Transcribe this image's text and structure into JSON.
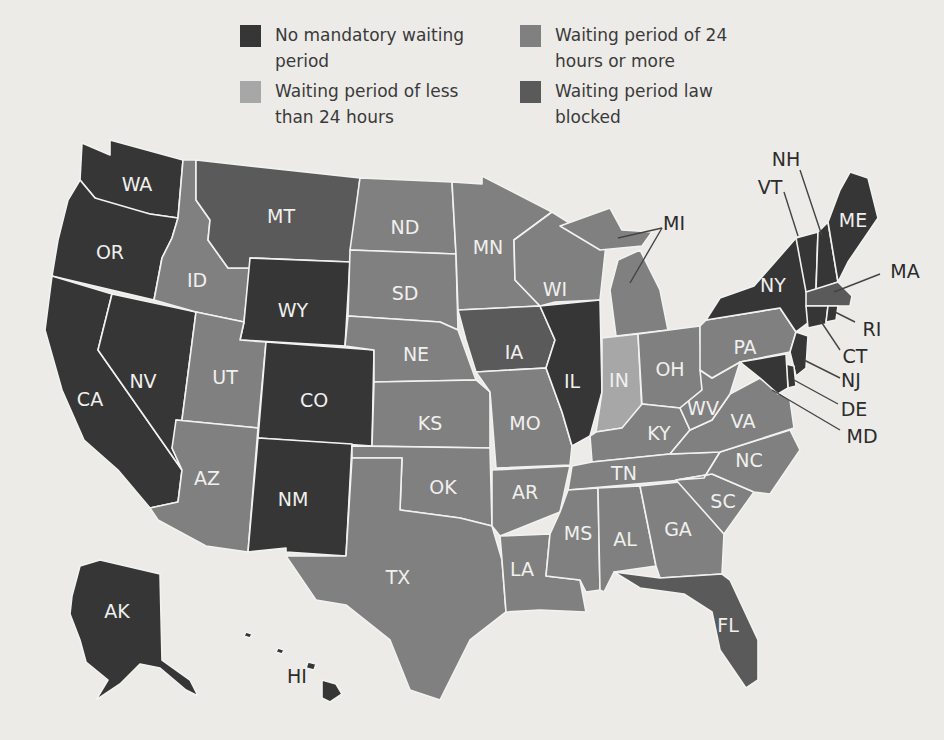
{
  "colors": {
    "none": "#363636",
    "lt24": "#a7a7a7",
    "gte24": "#808080",
    "blocked": "#5a5a5a",
    "background": "#ecebe8"
  },
  "legend": [
    {
      "key": "none",
      "label": "No mandatory waiting period",
      "color": "#363636"
    },
    {
      "key": "gte24",
      "label": "Waiting period of 24 hours or more",
      "color": "#808080"
    },
    {
      "key": "lt24",
      "label": "Waiting period of less than 24 hours",
      "color": "#a7a7a7"
    },
    {
      "key": "blocked",
      "label": "Waiting period law blocked",
      "color": "#5a5a5a"
    }
  ],
  "states": {
    "WA": {
      "label": "WA",
      "category": "none"
    },
    "OR": {
      "label": "OR",
      "category": "none"
    },
    "CA": {
      "label": "CA",
      "category": "none"
    },
    "NV": {
      "label": "NV",
      "category": "none"
    },
    "ID": {
      "label": "ID",
      "category": "gte24"
    },
    "MT": {
      "label": "MT",
      "category": "blocked"
    },
    "WY": {
      "label": "WY",
      "category": "none"
    },
    "UT": {
      "label": "UT",
      "category": "gte24"
    },
    "CO": {
      "label": "CO",
      "category": "none"
    },
    "AZ": {
      "label": "AZ",
      "category": "gte24"
    },
    "NM": {
      "label": "NM",
      "category": "none"
    },
    "ND": {
      "label": "ND",
      "category": "gte24"
    },
    "SD": {
      "label": "SD",
      "category": "gte24"
    },
    "NE": {
      "label": "NE",
      "category": "gte24"
    },
    "KS": {
      "label": "KS",
      "category": "gte24"
    },
    "OK": {
      "label": "OK",
      "category": "gte24"
    },
    "TX": {
      "label": "TX",
      "category": "gte24"
    },
    "MN": {
      "label": "MN",
      "category": "gte24"
    },
    "IA": {
      "label": "IA",
      "category": "blocked"
    },
    "MO": {
      "label": "MO",
      "category": "gte24"
    },
    "AR": {
      "label": "AR",
      "category": "gte24"
    },
    "LA": {
      "label": "LA",
      "category": "gte24"
    },
    "WI": {
      "label": "WI",
      "category": "gte24"
    },
    "IL": {
      "label": "IL",
      "category": "none"
    },
    "MI": {
      "label": "MI",
      "category": "gte24"
    },
    "IN": {
      "label": "IN",
      "category": "lt24"
    },
    "OH": {
      "label": "OH",
      "category": "gte24"
    },
    "KY": {
      "label": "KY",
      "category": "gte24"
    },
    "TN": {
      "label": "TN",
      "category": "gte24"
    },
    "MS": {
      "label": "MS",
      "category": "gte24"
    },
    "AL": {
      "label": "AL",
      "category": "gte24"
    },
    "GA": {
      "label": "GA",
      "category": "gte24"
    },
    "FL": {
      "label": "FL",
      "category": "blocked"
    },
    "SC": {
      "label": "SC",
      "category": "gte24"
    },
    "NC": {
      "label": "NC",
      "category": "gte24"
    },
    "VA": {
      "label": "VA",
      "category": "gte24"
    },
    "WV": {
      "label": "WV",
      "category": "gte24"
    },
    "PA": {
      "label": "PA",
      "category": "gte24"
    },
    "NY": {
      "label": "NY",
      "category": "none"
    },
    "VT": {
      "label": "VT",
      "category": "none"
    },
    "NH": {
      "label": "NH",
      "category": "none"
    },
    "ME": {
      "label": "ME",
      "category": "none"
    },
    "MA": {
      "label": "MA",
      "category": "blocked"
    },
    "RI": {
      "label": "RI",
      "category": "none"
    },
    "CT": {
      "label": "CT",
      "category": "none"
    },
    "NJ": {
      "label": "NJ",
      "category": "none"
    },
    "DE": {
      "label": "DE",
      "category": "none"
    },
    "MD": {
      "label": "MD",
      "category": "none"
    },
    "AK": {
      "label": "AK",
      "category": "none"
    },
    "HI": {
      "label": "HI",
      "category": "none"
    }
  }
}
